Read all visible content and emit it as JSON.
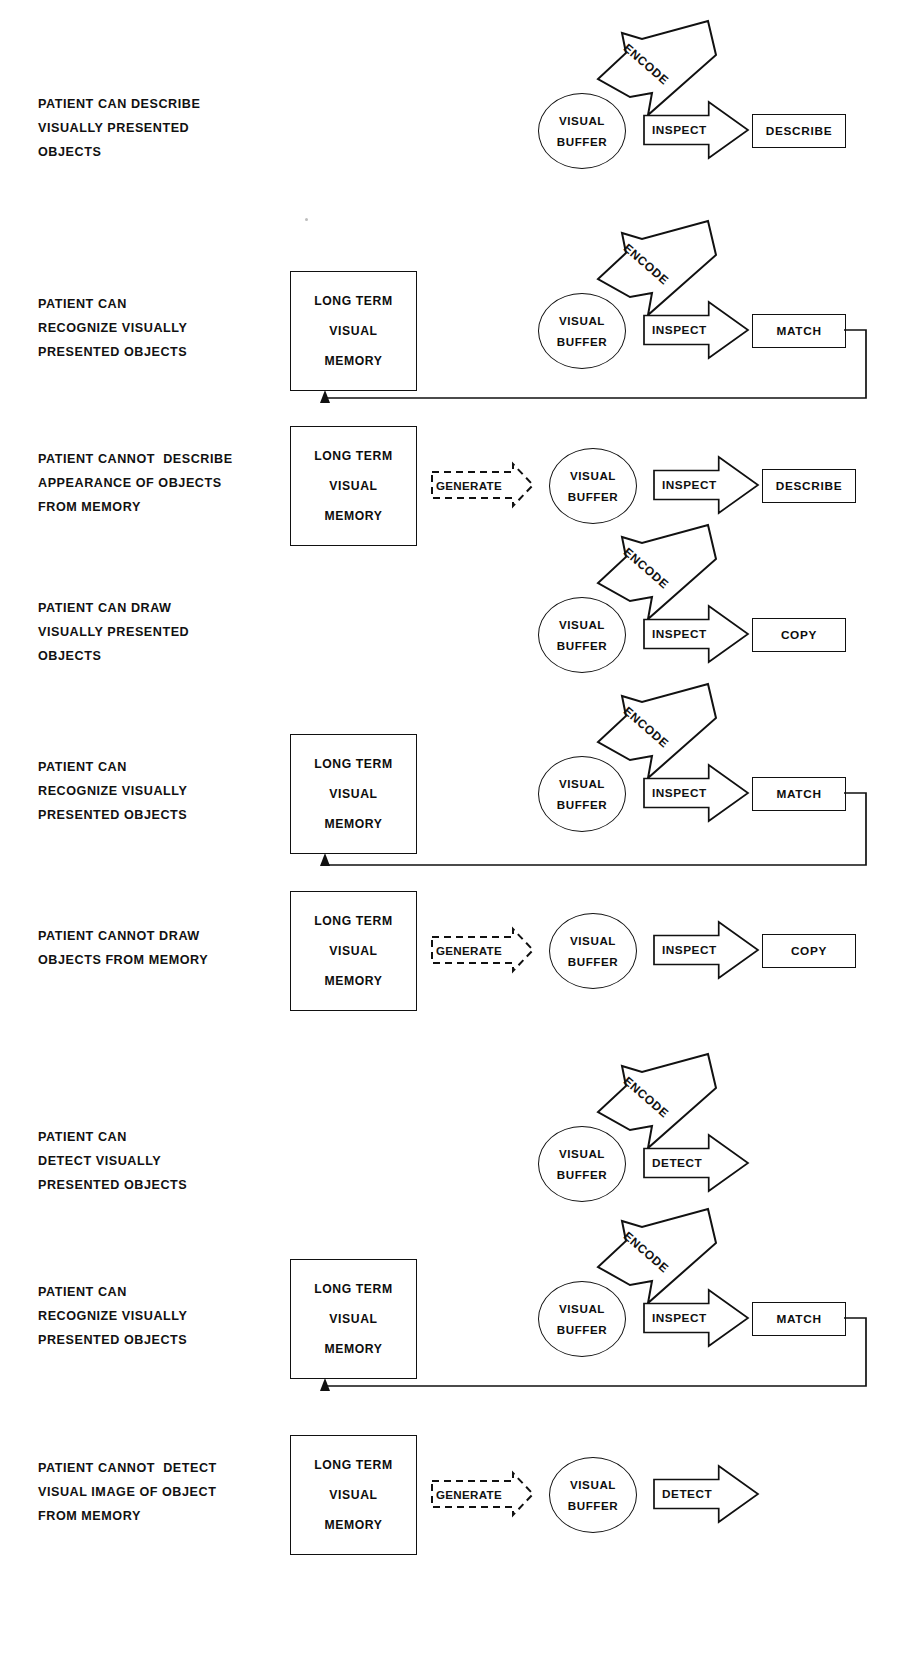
{
  "page": {
    "header_faint": "",
    "width": 899,
    "height": 1656,
    "ink_color": "#111111",
    "background_color": "#ffffff"
  },
  "glossary": {
    "ltm_line1": "LONG TERM",
    "ltm_line2": "VISUAL",
    "ltm_line3": "MEMORY",
    "vbuf_line1": "VISUAL",
    "vbuf_line2": "BUFFER",
    "encode": "ENCODE",
    "inspect": "INSPECT",
    "detect": "DETECT",
    "generate": "GENERATE",
    "describe": "DESCRIBE",
    "match": "MATCH",
    "copy": "COPY"
  },
  "rows": [
    {
      "id": "row-1",
      "label_lines": [
        "PATIENT CAN DESCRIBE",
        "VISUALLY PRESENTED",
        "OBJECTS"
      ],
      "has_ltm": false,
      "has_generate": false,
      "has_encode": true,
      "process_label": "INSPECT",
      "output_label": "DESCRIBE",
      "has_output": true,
      "has_feedback": false
    },
    {
      "id": "row-2",
      "label_lines": [
        "PATIENT CAN",
        "RECOGNIZE VISUALLY",
        "PRESENTED OBJECTS"
      ],
      "has_ltm": true,
      "has_generate": false,
      "has_encode": true,
      "process_label": "INSPECT",
      "output_label": "MATCH",
      "has_output": true,
      "has_feedback": true
    },
    {
      "id": "row-3",
      "label_lines": [
        "PATIENT CANNOT  DESCRIBE",
        "APPEARANCE OF OBJECTS",
        "FROM MEMORY"
      ],
      "has_ltm": true,
      "has_generate": true,
      "has_encode": false,
      "process_label": "INSPECT",
      "output_label": "DESCRIBE",
      "has_output": true,
      "has_feedback": false
    },
    {
      "id": "row-4",
      "label_lines": [
        "PATIENT CAN DRAW",
        "VISUALLY PRESENTED",
        "OBJECTS"
      ],
      "has_ltm": false,
      "has_generate": false,
      "has_encode": true,
      "process_label": "INSPECT",
      "output_label": "COPY",
      "has_output": true,
      "has_feedback": false
    },
    {
      "id": "row-5",
      "label_lines": [
        "PATIENT CAN",
        "RECOGNIZE VISUALLY",
        "PRESENTED OBJECTS"
      ],
      "has_ltm": true,
      "has_generate": false,
      "has_encode": true,
      "process_label": "INSPECT",
      "output_label": "MATCH",
      "has_output": true,
      "has_feedback": true
    },
    {
      "id": "row-6",
      "label_lines": [
        "PATIENT CANNOT DRAW",
        "OBJECTS FROM MEMORY"
      ],
      "has_ltm": true,
      "has_generate": true,
      "has_encode": false,
      "process_label": "INSPECT",
      "output_label": "COPY",
      "has_output": true,
      "has_feedback": false
    },
    {
      "id": "row-7",
      "label_lines": [
        "PATIENT CAN",
        "DETECT VISUALLY",
        "PRESENTED OBJECTS"
      ],
      "has_ltm": false,
      "has_generate": false,
      "has_encode": true,
      "process_label": "DETECT",
      "output_label": "",
      "has_output": false,
      "has_feedback": false
    },
    {
      "id": "row-8",
      "label_lines": [
        "PATIENT CAN",
        "RECOGNIZE VISUALLY",
        "PRESENTED OBJECTS"
      ],
      "has_ltm": true,
      "has_generate": false,
      "has_encode": true,
      "process_label": "INSPECT",
      "output_label": "MATCH",
      "has_output": true,
      "has_feedback": true
    },
    {
      "id": "row-9",
      "label_lines": [
        "PATIENT CANNOT  DETECT",
        "VISUAL IMAGE OF OBJECT",
        "FROM MEMORY"
      ],
      "has_ltm": true,
      "has_generate": true,
      "has_encode": false,
      "process_label": "DETECT",
      "output_label": "",
      "has_output": false,
      "has_feedback": false
    }
  ]
}
